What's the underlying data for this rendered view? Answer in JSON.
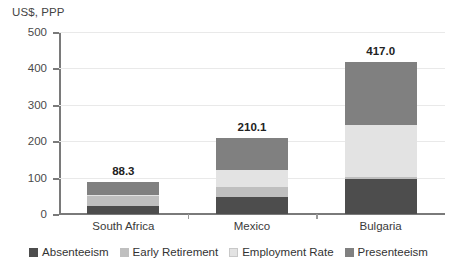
{
  "chart_data": {
    "type": "bar",
    "subtype": "stacked-bar",
    "title": "",
    "ylabel": "US$, PPP",
    "xlabel": "",
    "ylim": [
      0,
      500
    ],
    "yticks": [
      0,
      100,
      200,
      300,
      400,
      500
    ],
    "ytick_labels": [
      "0",
      "100",
      "200",
      "300",
      "400",
      "500"
    ],
    "grid": true,
    "grid_axis": "y",
    "legend_position": "bottom",
    "categories": [
      "South Africa",
      "Mexico",
      "Bulgaria"
    ],
    "totals": [
      88.3,
      210.1,
      417.0
    ],
    "total_labels": [
      "88.3",
      "210.1",
      "417.0"
    ],
    "series": [
      {
        "name": "Absenteeism",
        "color": "#4d4d4d",
        "values": [
          22.0,
          48.0,
          95.0
        ]
      },
      {
        "name": "Early Retirement",
        "color": "#bfbfbf",
        "values": [
          27.0,
          26.0,
          8.0
        ]
      },
      {
        "name": "Employment Rate",
        "color": "#e3e3e3",
        "values": [
          3.0,
          48.0,
          142.0
        ]
      },
      {
        "name": "Presenteeism",
        "color": "#808080",
        "values": [
          36.3,
          88.1,
          172.0
        ]
      }
    ]
  },
  "axis": {
    "y_title": "US$, PPP"
  },
  "colors": {
    "absenteeism": "#4d4d4d",
    "early_retirement": "#bfbfbf",
    "employment_rate": "#e3e3e3",
    "presenteeism": "#808080",
    "gridline": "#e9e9e9",
    "axis": "#7a7a7a",
    "background": "#ffffff"
  }
}
